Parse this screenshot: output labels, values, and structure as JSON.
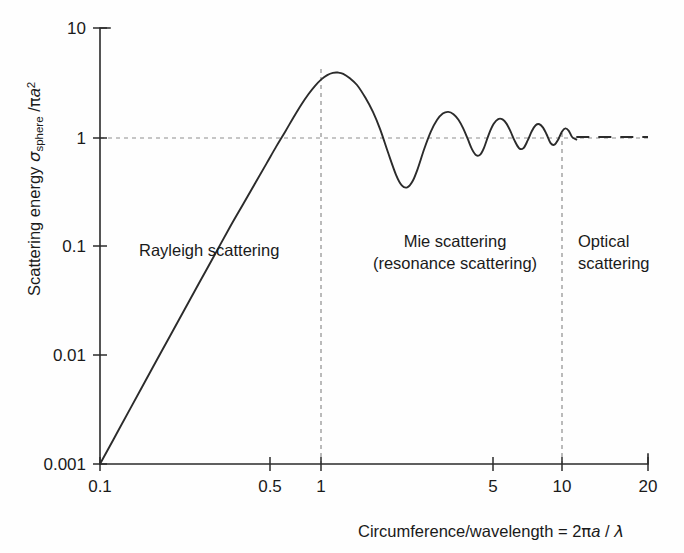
{
  "figure": {
    "background_color": "#fefefe",
    "curve_color": "#2b2b2b",
    "grid_color": "#8d8d8d"
  },
  "axes": {
    "x": {
      "label_parts": {
        "main": "Circumference/wavelength",
        "equals": " = 2",
        "pi": "π",
        "a": "a",
        "slash": " / ",
        "lambda": "λ"
      },
      "label_full": "Circumference/wavelength  = 2πa / λ",
      "ticks": [
        "0.1",
        "0.5",
        "1",
        "5",
        "10",
        "20"
      ],
      "tick_values": [
        0.1,
        0.5,
        1,
        5,
        10,
        20
      ],
      "scale": "log",
      "range": [
        0.1,
        20
      ]
    },
    "y": {
      "label_parts": {
        "main": "Scattering energy ",
        "sigma": "σ",
        "subscript": "sphere",
        "divider": " /",
        "pi": "π",
        "a": "a",
        "exponent": "2"
      },
      "label_full": "Scattering energy σsphere /πa2",
      "ticks": [
        "0.001",
        "0.01",
        "0.1",
        "1",
        "10"
      ],
      "tick_values": [
        0.001,
        0.01,
        0.1,
        1,
        10
      ],
      "scale": "log",
      "range": [
        0.001,
        10
      ]
    }
  },
  "annotations": [
    {
      "id": "rayleigh",
      "text": "Rayleigh scattering",
      "lines": [
        "Rayleigh scattering"
      ]
    },
    {
      "id": "mie",
      "text": "Mie scattering (resonance scattering)",
      "lines": [
        "Mie scattering",
        "(resonance scattering)"
      ]
    },
    {
      "id": "optical",
      "text": "Optical scattering",
      "lines": [
        "Optical",
        "scattering"
      ]
    }
  ],
  "guides": {
    "horizontal_unity": {
      "value": 1,
      "style": "dashed"
    },
    "vertical_x1": {
      "value": 1,
      "style": "dashed"
    },
    "vertical_x10": {
      "value": 10,
      "style": "dashed"
    }
  },
  "chart_data": {
    "type": "line",
    "title": "",
    "xlabel": "Circumference/wavelength  = 2πa / λ",
    "ylabel": "Scattering energy σsphere /πa2",
    "xscale": "log",
    "yscale": "log",
    "xlim": [
      0.1,
      20
    ],
    "ylim": [
      0.001,
      10
    ],
    "xticks": [
      0.1,
      0.5,
      1,
      5,
      10,
      20
    ],
    "xticklabels": [
      "0.1",
      "0.5",
      "1",
      "5",
      "10",
      "20"
    ],
    "yticks": [
      0.001,
      0.01,
      0.1,
      1,
      10
    ],
    "yticklabels": [
      "0.001",
      "0.01",
      "0.1",
      "1",
      "10"
    ],
    "grid": false,
    "legend": null,
    "series": [
      {
        "name": "Mie scattering efficiency",
        "style": "solid",
        "x": [
          0.1,
          0.12,
          0.15,
          0.18,
          0.22,
          0.26,
          0.3,
          0.35,
          0.4,
          0.45,
          0.5,
          0.55,
          0.6,
          0.65,
          0.7,
          0.75,
          0.8,
          0.85,
          0.9,
          0.95,
          1.0,
          1.05,
          1.12,
          1.2,
          1.3,
          1.4,
          1.5,
          1.62,
          1.75,
          1.85,
          1.95,
          2.05,
          2.15,
          2.3,
          2.45,
          2.6,
          2.75,
          2.9,
          3.05,
          3.2,
          3.35,
          3.5,
          3.65,
          3.8,
          3.95,
          4.1,
          4.3,
          4.5,
          4.7,
          4.9,
          5.1,
          5.3,
          5.5,
          5.75,
          6.0,
          6.25,
          6.5,
          6.75,
          7.0,
          7.25,
          7.5,
          7.8,
          8.1,
          8.4,
          8.7,
          9.0,
          9.3,
          9.6,
          10.0
        ],
        "y": [
          0.001,
          0.00207,
          0.00506,
          0.01048,
          0.0233,
          0.0453,
          0.0797,
          0.147,
          0.244,
          0.382,
          0.57,
          0.82,
          1.125,
          1.52,
          1.98,
          2.47,
          2.95,
          3.38,
          3.7,
          3.88,
          3.9,
          3.8,
          3.46,
          3.0,
          2.3,
          1.7,
          1.18,
          0.72,
          0.45,
          0.36,
          0.345,
          0.39,
          0.5,
          0.78,
          1.12,
          1.43,
          1.64,
          1.7,
          1.62,
          1.44,
          1.2,
          0.96,
          0.77,
          0.68,
          0.69,
          0.8,
          1.07,
          1.32,
          1.46,
          1.45,
          1.32,
          1.12,
          0.93,
          0.79,
          0.79,
          0.93,
          1.13,
          1.28,
          1.31,
          1.22,
          1.06,
          0.88,
          0.85,
          0.95,
          1.12,
          1.2,
          1.14,
          1.0,
          0.95
        ]
      },
      {
        "name": "Optical (geometric) limit",
        "style": "dashed",
        "x": [
          10.0,
          20.0
        ],
        "y": [
          1.0,
          1.0
        ]
      }
    ],
    "annotations": [
      {
        "text": "Rayleigh scattering",
        "x": 0.5,
        "y": 0.105
      },
      {
        "text": "Mie scattering\n(resonance scattering)",
        "x": 3.3,
        "y": 0.105
      },
      {
        "text": "Optical\nscattering",
        "x": 14.0,
        "y": 0.105
      }
    ],
    "reference_lines": [
      {
        "orientation": "horizontal",
        "value": 1,
        "style": "dashed"
      },
      {
        "orientation": "vertical",
        "value": 1,
        "style": "dashed"
      },
      {
        "orientation": "vertical",
        "value": 10,
        "style": "dashed"
      }
    ]
  }
}
